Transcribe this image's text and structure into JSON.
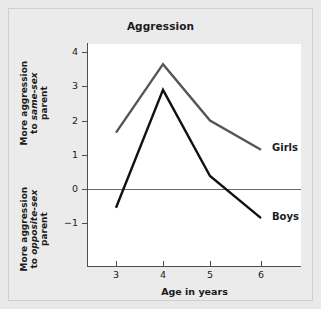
{
  "chart_data": {
    "type": "line",
    "title": "Aggression",
    "xlabel": "Age in years",
    "ylabel_upper": "More aggression to same-sex parent",
    "ylabel_lower": "More aggression to opposite-sex parent",
    "ylabel_upper_parts": [
      "More aggression",
      "to ",
      "same-sex",
      "parent"
    ],
    "ylabel_lower_parts": [
      "More aggression",
      "to ",
      "opposite-sex",
      "parent"
    ],
    "x": [
      3,
      4,
      5,
      6
    ],
    "xticklabels": [
      "3",
      "4",
      "5",
      "6"
    ],
    "yticklabels": [
      "4",
      "3",
      "2",
      "1",
      "0",
      "−1"
    ],
    "yticks": [
      4,
      3,
      2,
      1,
      0,
      -1
    ],
    "xlim": [
      2.4,
      6.6
    ],
    "ylim": [
      -1.8,
      4.2
    ],
    "grid": false,
    "zero_line": 0,
    "legend": "inline-end-labels",
    "series": [
      {
        "name": "Girls",
        "values": [
          1.65,
          3.65,
          2.0,
          1.15
        ],
        "color": "#555555"
      },
      {
        "name": "Boys",
        "values": [
          -0.55,
          2.9,
          0.38,
          -0.85
        ],
        "color": "#111111"
      }
    ]
  },
  "colors": {
    "page_background": "#e9e9e9",
    "plot_background": "#ffffff",
    "axis": "#4d4d4d",
    "text": "#1b1b1b",
    "girls_line": "#555555",
    "boys_line": "#111111"
  }
}
